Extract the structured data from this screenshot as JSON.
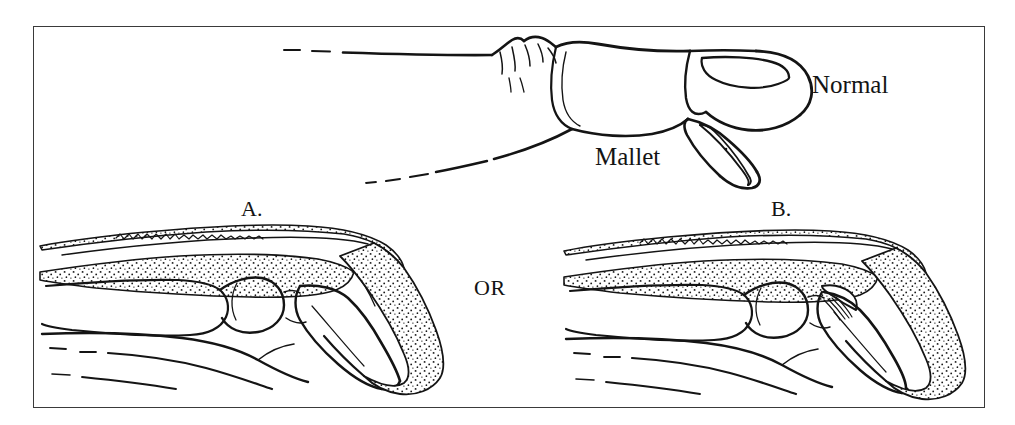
{
  "figure": {
    "kind": "medical-line-illustration",
    "background_color": "#ffffff",
    "ink_color": "#141414",
    "frame_color": "#3a3a3a",
    "stipple_color": "#1a1a1a"
  },
  "labels": {
    "normal": "Normal",
    "mallet": "Mallet",
    "panel_a": "A.",
    "panel_b": "B.",
    "or": "OR"
  },
  "panels": [
    {
      "id": "top-external-view",
      "caption": "",
      "description": "Lateral external view of two fingers: upper finger fully extended labeled Normal, lower finger with drooped distal phalanx labeled Mallet"
    },
    {
      "id": "panel-a-tendon-avulsion",
      "caption": "A.",
      "description": "Sagittal cutaway of distal finger showing extensor tendon ruptured from the dorsal base of the distal phalanx, distal phalanx flexed"
    },
    {
      "id": "panel-b-bony-avulsion",
      "caption": "B.",
      "description": "Sagittal cutaway of distal finger showing bony avulsion fragment pulled off the dorsal base of the distal phalanx by the extensor tendon"
    }
  ]
}
